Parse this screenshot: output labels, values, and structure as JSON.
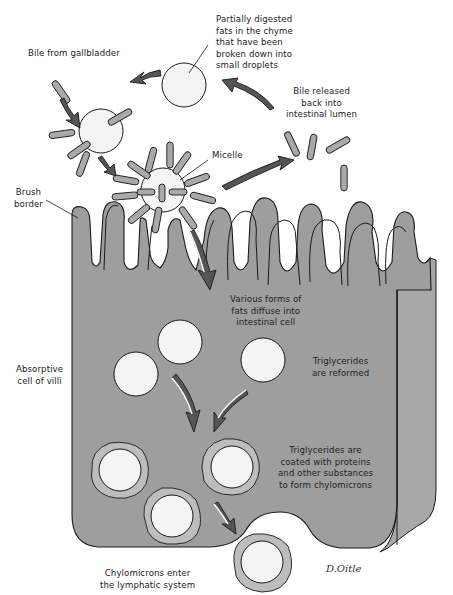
{
  "diagram": {
    "colors": {
      "cell_fill": "#9e9e9e",
      "cell_side_fill": "#a8a8a8",
      "outline": "#1a1a1a",
      "droplet_fill": "#f4f4f4",
      "bile_rod_fill": "#a9a9a9",
      "chylomicron_coat": "#bdbdbd",
      "arrow_dark": "#555555",
      "arrow_light": "#ffffff"
    },
    "labels": {
      "partially_digested": [
        "Partially digested",
        "fats in the chyme",
        "that have been",
        "broken down into",
        "small droplets"
      ],
      "bile_from_gallbladder": [
        "Bile from gallbladder"
      ],
      "bile_released": [
        "Bile released",
        "back into",
        "intestinal lumen"
      ],
      "micelle": [
        "Micelle"
      ],
      "brush_border": [
        "Brush",
        "border"
      ],
      "various_forms": [
        "Various forms of",
        "fats diffuse into",
        "intestinal cell"
      ],
      "absorptive_cell": [
        "Absorptive",
        "cell of villi"
      ],
      "triglycerides_reformed": [
        "Triglycerides",
        "are reformed"
      ],
      "triglycerides_coated": [
        "Triglycerides are",
        "coated with proteins",
        "and other substances",
        "to form chylomicrons"
      ],
      "chylomicrons_enter": [
        "Chylomicrons enter",
        "the lymphatic system"
      ]
    },
    "signature": "D.Oitle",
    "nodes": [
      {
        "id": "fat-droplet",
        "label": "Partially digested fat droplet"
      },
      {
        "id": "bile-coated-droplet",
        "label": "Droplet with bile salts"
      },
      {
        "id": "micelle",
        "label": "Micelle"
      },
      {
        "id": "free-bile",
        "label": "Bile released back into intestinal lumen"
      },
      {
        "id": "intestinal-cell",
        "label": "Absorptive cell of villi"
      },
      {
        "id": "triglycerides",
        "label": "Triglycerides are reformed"
      },
      {
        "id": "chylomicrons",
        "label": "Chylomicrons"
      },
      {
        "id": "lymphatic",
        "label": "Lymphatic system"
      }
    ],
    "edges": [
      {
        "from": "fat-droplet",
        "to": "bile-coated-droplet"
      },
      {
        "from": "bile-coated-droplet",
        "to": "micelle"
      },
      {
        "from": "micelle",
        "to": "free-bile"
      },
      {
        "from": "free-bile",
        "to": "fat-droplet"
      },
      {
        "from": "micelle",
        "to": "intestinal-cell"
      },
      {
        "from": "intestinal-cell",
        "to": "triglycerides"
      },
      {
        "from": "triglycerides",
        "to": "chylomicrons"
      },
      {
        "from": "chylomicrons",
        "to": "lymphatic"
      }
    ]
  }
}
